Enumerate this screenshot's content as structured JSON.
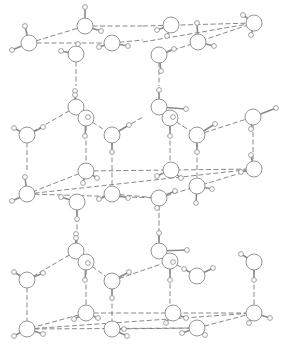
{
  "title": "Ice crystal structure (hydrogen-bonded water molecules)",
  "colors": {
    "background": "#ffffff",
    "line": "#8a8a8a"
  },
  "oxygens": [
    {
      "id": "a1",
      "x": 29,
      "y": 43,
      "h": [
        [
          25,
          26
        ],
        [
          12,
          50
        ]
      ]
    },
    {
      "id": "a2",
      "x": 85,
      "y": 26,
      "h": [
        [
          85,
          7
        ],
        [
          101,
          31
        ]
      ]
    },
    {
      "id": "a3",
      "x": 112,
      "y": 43,
      "h": [
        [
          99,
          47
        ],
        [
          128,
          46
        ]
      ]
    },
    {
      "id": "a4",
      "x": 76,
      "y": 54,
      "h": [
        [
          61,
          51
        ],
        [
          78,
          44
        ]
      ]
    },
    {
      "id": "a5",
      "x": 171,
      "y": 25,
      "h": [
        [
          157,
          30
        ],
        [
          167,
          36
        ]
      ]
    },
    {
      "id": "a6",
      "x": 198,
      "y": 42,
      "h": [
        [
          197,
          23
        ],
        [
          214,
          46
        ]
      ]
    },
    {
      "id": "a7",
      "x": 159,
      "y": 55,
      "h": [
        [
          174,
          49
        ],
        [
          161,
          71
        ]
      ]
    },
    {
      "id": "a8",
      "x": 254,
      "y": 23,
      "h": [
        [
          243,
          15
        ],
        [
          251,
          35
        ]
      ]
    },
    {
      "id": "b1",
      "x": 76,
      "y": 107,
      "h": [
        [
          75,
          91
        ],
        [
          75,
          95
        ]
      ]
    },
    {
      "id": "b2",
      "x": 86,
      "y": 118,
      "h": [
        [
          88,
          117
        ],
        [
          85,
          136
        ]
      ]
    },
    {
      "id": "b3",
      "x": 27,
      "y": 135,
      "h": [
        [
          14,
          128
        ],
        [
          43,
          127
        ]
      ]
    },
    {
      "id": "b4",
      "x": 112,
      "y": 135,
      "h": [
        [
          129,
          125
        ],
        [
          112,
          152
        ]
      ]
    },
    {
      "id": "b5",
      "x": 159,
      "y": 107,
      "h": [
        [
          186,
          109
        ],
        [
          159,
          90
        ]
      ]
    },
    {
      "id": "b6",
      "x": 170,
      "y": 118,
      "h": [
        [
          173,
          117
        ],
        [
          170,
          136
        ]
      ]
    },
    {
      "id": "b7",
      "x": 197,
      "y": 135,
      "h": [
        [
          215,
          124
        ],
        [
          197,
          152
        ]
      ]
    },
    {
      "id": "b8",
      "x": 253,
      "y": 117,
      "h": [
        [
          276,
          108
        ],
        [
          251,
          129
        ]
      ]
    },
    {
      "id": "c1",
      "x": 86,
      "y": 171,
      "h": [
        [
          83,
          183
        ],
        [
          97,
          178
        ]
      ]
    },
    {
      "id": "c2",
      "x": 27,
      "y": 194,
      "h": [
        [
          25,
          177
        ],
        [
          12,
          201
        ]
      ]
    },
    {
      "id": "c3",
      "x": 112,
      "y": 194,
      "h": [
        [
          99,
          199
        ],
        [
          128,
          198
        ]
      ]
    },
    {
      "id": "c4",
      "x": 171,
      "y": 170,
      "h": [
        [
          157,
          176
        ],
        [
          181,
          178
        ]
      ]
    },
    {
      "id": "c5",
      "x": 197,
      "y": 186,
      "h": [
        [
          196,
          203
        ],
        [
          212,
          189
        ]
      ]
    },
    {
      "id": "c6",
      "x": 159,
      "y": 198,
      "h": [
        [
          175,
          191
        ],
        [
          157,
          208
        ]
      ]
    },
    {
      "id": "c7",
      "x": 254,
      "y": 169,
      "h": [
        [
          241,
          172
        ],
        [
          251,
          155
        ]
      ]
    },
    {
      "id": "c8",
      "x": 77,
      "y": 202,
      "h": [
        [
          61,
          197
        ],
        [
          77,
          219
        ]
      ]
    },
    {
      "id": "d1",
      "x": 76,
      "y": 251,
      "h": [
        [
          76,
          234
        ],
        [
          76,
          238
        ]
      ]
    },
    {
      "id": "d2",
      "x": 86,
      "y": 262,
      "h": [
        [
          88,
          263
        ],
        [
          85,
          280
        ]
      ]
    },
    {
      "id": "d3",
      "x": 27,
      "y": 280,
      "h": [
        [
          14,
          272
        ],
        [
          43,
          273
        ]
      ]
    },
    {
      "id": "d4",
      "x": 112,
      "y": 281,
      "h": [
        [
          129,
          272
        ],
        [
          112,
          298
        ]
      ]
    },
    {
      "id": "d5",
      "x": 159,
      "y": 251,
      "h": [
        [
          187,
          250
        ],
        [
          159,
          233
        ]
      ]
    },
    {
      "id": "d6",
      "x": 170,
      "y": 261,
      "h": [
        [
          173,
          262
        ],
        [
          170,
          280
        ]
      ]
    },
    {
      "id": "d7",
      "x": 197,
      "y": 276,
      "h": [
        [
          184,
          269
        ],
        [
          213,
          268
        ]
      ]
    },
    {
      "id": "d8",
      "x": 254,
      "y": 262,
      "h": [
        [
          241,
          254
        ],
        [
          254,
          280
        ]
      ]
    },
    {
      "id": "e1",
      "x": 86,
      "y": 313,
      "h": [
        [
          74,
          319
        ],
        [
          98,
          318
        ]
      ]
    },
    {
      "id": "e2",
      "x": 27,
      "y": 329,
      "h": [
        [
          14,
          336
        ],
        [
          43,
          334
        ]
      ]
    },
    {
      "id": "e3",
      "x": 112,
      "y": 329,
      "h": [
        [
          127,
          336
        ],
        [
          124,
          329
        ]
      ]
    },
    {
      "id": "e4",
      "x": 197,
      "y": 328,
      "h": [
        [
          182,
          333
        ],
        [
          205,
          335
        ]
      ]
    },
    {
      "id": "e5",
      "x": 254,
      "y": 313,
      "h": [
        [
          249,
          323
        ],
        [
          270,
          318
        ]
      ]
    },
    {
      "id": "e6",
      "x": 173,
      "y": 313,
      "h": [
        [
          186,
          318
        ],
        [
          166,
          323
        ]
      ]
    }
  ],
  "hbonds": [
    [
      29,
      43,
      85,
      26
    ],
    [
      29,
      43,
      112,
      43
    ],
    [
      85,
      26,
      143,
      26
    ],
    [
      112,
      43,
      143,
      40
    ],
    [
      143,
      26,
      254,
      23
    ],
    [
      143,
      42,
      254,
      23
    ],
    [
      159,
      55,
      254,
      23
    ],
    [
      76,
      54,
      76,
      86
    ],
    [
      159,
      55,
      159,
      86
    ],
    [
      86,
      118,
      112,
      135
    ],
    [
      112,
      135,
      143,
      117
    ],
    [
      76,
      107,
      27,
      135
    ],
    [
      27,
      135,
      27,
      172
    ],
    [
      86,
      118,
      86,
      166
    ],
    [
      112,
      135,
      112,
      186
    ],
    [
      170,
      118,
      197,
      135
    ],
    [
      197,
      135,
      253,
      117
    ],
    [
      170,
      118,
      170,
      166
    ],
    [
      197,
      135,
      197,
      182
    ],
    [
      253,
      117,
      253,
      162
    ],
    [
      86,
      171,
      27,
      194
    ],
    [
      86,
      171,
      254,
      169
    ],
    [
      27,
      194,
      254,
      169
    ],
    [
      27,
      194,
      159,
      198
    ],
    [
      159,
      198,
      254,
      169
    ],
    [
      112,
      194,
      159,
      198
    ],
    [
      77,
      202,
      77,
      244
    ],
    [
      159,
      198,
      159,
      244
    ],
    [
      76,
      251,
      27,
      280
    ],
    [
      86,
      262,
      112,
      281
    ],
    [
      112,
      281,
      170,
      261
    ],
    [
      170,
      261,
      197,
      276
    ],
    [
      27,
      280,
      27,
      322
    ],
    [
      86,
      262,
      86,
      306
    ],
    [
      112,
      281,
      112,
      322
    ],
    [
      170,
      261,
      170,
      306
    ],
    [
      254,
      262,
      254,
      306
    ],
    [
      86,
      313,
      27,
      329
    ],
    [
      86,
      313,
      254,
      313
    ],
    [
      27,
      329,
      254,
      313
    ],
    [
      27,
      329,
      197,
      328
    ],
    [
      197,
      328,
      254,
      313
    ],
    [
      112,
      329,
      197,
      328
    ]
  ]
}
